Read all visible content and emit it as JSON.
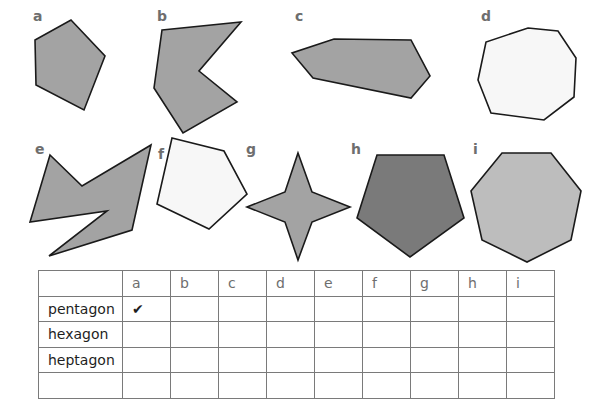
{
  "shapes": [
    {
      "label": "a",
      "fill": "#a3a3a3",
      "points": "71,20 105,56 84,110 36,85 35,40"
    },
    {
      "label": "b",
      "fill": "#a3a3a3",
      "points": "162,30 241,22 199,71 237,102 183,133 154,88"
    },
    {
      "label": "c",
      "fill": "#a3a3a3",
      "points": "334,39 411,40 430,76 411,98 313,78 292,53"
    },
    {
      "label": "d",
      "fill": "#f7f7f7",
      "points": "528,28 558,31 576,58 574,97 544,120 491,113 478,80 486,42"
    },
    {
      "label": "e",
      "fill": "#a3a3a3",
      "points": "50,155 82,186 151,145 132,230 49,256 107,211 30,222"
    },
    {
      "label": "f",
      "fill": "#f7f7f7",
      "points": "172,138 224,151 247,194 209,229 157,204"
    },
    {
      "label": "g",
      "fill": "#a3a3a3",
      "points": "298,153 312,192 350,207 312,222 298,260 285,222 247,207 285,192"
    },
    {
      "label": "h",
      "fill": "#7a7a7a",
      "points": "377,155 444,155 464,218 410,257 357,218"
    },
    {
      "label": "i",
      "fill": "#bdbdbd",
      "points": "502,153 551,153 581,191 571,240 527,262 482,240 471,191"
    }
  ],
  "shape_label_positions": [
    {
      "label": "a",
      "x": 33,
      "y": 10
    },
    {
      "label": "b",
      "x": 157,
      "y": 10
    },
    {
      "label": "c",
      "x": 295,
      "y": 10
    },
    {
      "label": "d",
      "x": 481,
      "y": 10
    },
    {
      "label": "e",
      "x": 35,
      "y": 143
    },
    {
      "label": "f",
      "x": 158,
      "y": 148
    },
    {
      "label": "g",
      "x": 246,
      "y": 143
    },
    {
      "label": "h",
      "x": 351,
      "y": 143
    },
    {
      "label": "i",
      "x": 473,
      "y": 143
    }
  ],
  "table": {
    "columns": [
      "",
      "a",
      "b",
      "c",
      "d",
      "e",
      "f",
      "g",
      "h",
      "i"
    ],
    "rows": [
      {
        "label": "pentagon",
        "cells": [
          "✔",
          "",
          "",
          "",
          "",
          "",
          "",
          "",
          ""
        ]
      },
      {
        "label": "hexagon",
        "cells": [
          "",
          "",
          "",
          "",
          "",
          "",
          "",
          "",
          ""
        ]
      },
      {
        "label": "heptagon",
        "cells": [
          "",
          "",
          "",
          "",
          "",
          "",
          "",
          "",
          ""
        ]
      },
      {
        "label": "",
        "cells": [
          "",
          "",
          "",
          "",
          "",
          "",
          "",
          "",
          ""
        ]
      }
    ]
  },
  "colors": {
    "outline": "#1a1a1a",
    "grid_line": "#7a7a7a",
    "label_text": "#6e6e6e"
  }
}
